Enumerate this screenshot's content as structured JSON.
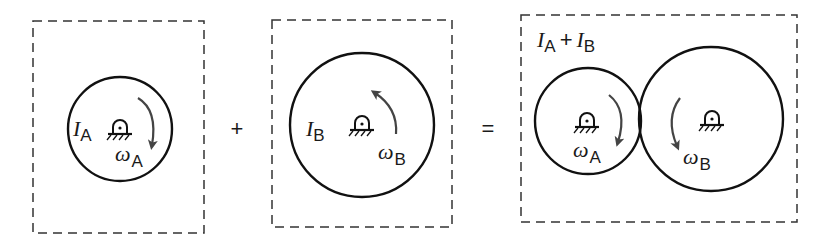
{
  "diagram": {
    "type": "moment-of-inertia-sum",
    "colors": {
      "outline": "#111111",
      "arrow": "#444444",
      "dashed_box": "#333333",
      "background": "#ffffff"
    },
    "panels": [
      {
        "id": "panel-a",
        "box": {
          "x": 33,
          "y": 21,
          "w": 171,
          "h": 212
        },
        "circles": [
          {
            "id": "disk-a",
            "cx": 120,
            "cy": 129,
            "r": 52,
            "inertia_symbol": "I",
            "inertia_sub": "A",
            "omega_symbol": "ω",
            "omega_sub": "A",
            "rotation": "clockwise"
          }
        ]
      },
      {
        "id": "panel-b",
        "box": {
          "x": 272,
          "y": 20,
          "w": 180,
          "h": 207
        },
        "circles": [
          {
            "id": "disk-b",
            "cx": 362,
            "cy": 125,
            "r": 72,
            "inertia_symbol": "I",
            "inertia_sub": "B",
            "omega_symbol": "ω",
            "omega_sub": "B",
            "rotation": "counterclockwise"
          }
        ]
      },
      {
        "id": "panel-combined",
        "box": {
          "x": 521,
          "y": 15,
          "w": 276,
          "h": 207
        },
        "label": {
          "sym1": "I",
          "sub1": "A",
          "plus": "+",
          "sym2": "I",
          "sub2": "B"
        },
        "circles": [
          {
            "id": "disk-a-combined",
            "cx": 588,
            "cy": 121,
            "r": 53,
            "omega_symbol": "ω",
            "omega_sub": "A",
            "rotation": "clockwise"
          },
          {
            "id": "disk-b-combined",
            "cx": 711,
            "cy": 119,
            "r": 72,
            "omega_symbol": "ω",
            "omega_sub": "B",
            "rotation": "clockwise"
          }
        ]
      }
    ],
    "operators": {
      "plus": "+",
      "equals": "="
    }
  }
}
